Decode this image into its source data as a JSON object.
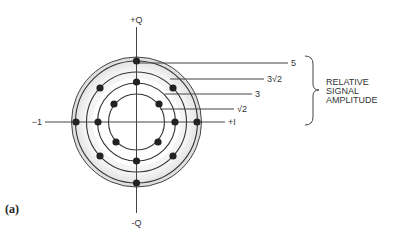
{
  "diagram": {
    "caption": "(a)",
    "axes": {
      "pos_q": "+Q",
      "neg_q": "-Q",
      "pos_i": "+I",
      "neg_i": "−1"
    },
    "rings": [
      {
        "label": "5",
        "radius_px": 61
      },
      {
        "label": "3√2",
        "radius_px": 50
      },
      {
        "label": "3",
        "radius_px": 39
      },
      {
        "label": "√2",
        "radius_px": 28
      }
    ],
    "brace_label": [
      "RELATIVE",
      "SIGNAL",
      "AMPLITUDE"
    ],
    "colors": {
      "line": "#333333",
      "dot": "#222222",
      "shade": "#e6e6e6"
    }
  }
}
